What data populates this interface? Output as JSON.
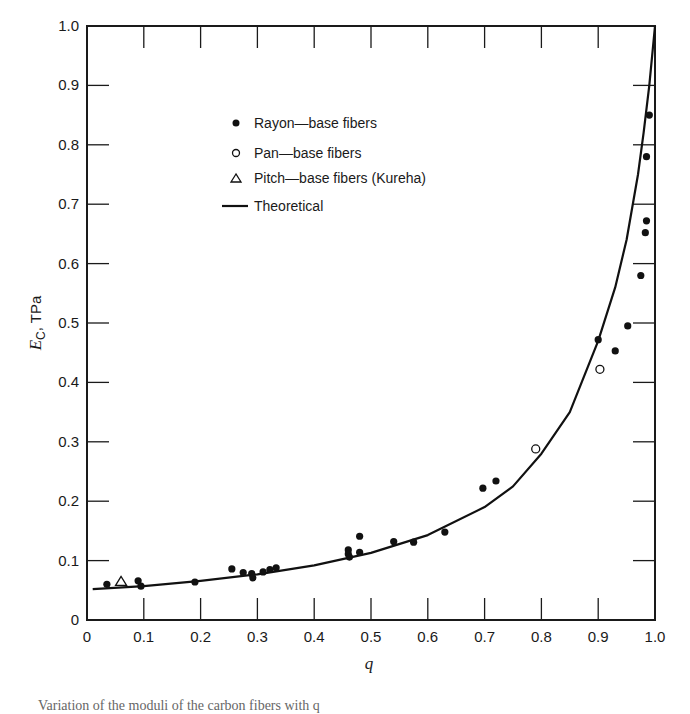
{
  "chart_data": {
    "type": "scatter",
    "title": "",
    "xlabel": "q",
    "ylabel": "E_C, TPa",
    "ylabel_main": "E",
    "ylabel_sub": "C",
    "ylabel_unit": ", TPa",
    "xlim": [
      0,
      1.0
    ],
    "ylim": [
      0,
      1.0
    ],
    "grid": false,
    "legend_position": "upper-left-inside",
    "x_ticks": [
      "0",
      "0.1",
      "0.2",
      "0.3",
      "0.4",
      "0.5",
      "0.6",
      "0.7",
      "0.8",
      "0.9",
      "1.0"
    ],
    "y_ticks": [
      "0",
      "0.1",
      "0.2",
      "0.3",
      "0.4",
      "0.5",
      "0.6",
      "0.7",
      "0.8",
      "0.9",
      "1.0"
    ],
    "legend": [
      {
        "marker": "filled-circle",
        "label": "Rayon—base fibers"
      },
      {
        "marker": "open-circle",
        "label": "Pan—base fibers"
      },
      {
        "marker": "open-triangle",
        "label": "Pitch—base fibers (Kureha)"
      },
      {
        "marker": "line",
        "label": "Theoretical"
      }
    ],
    "series": [
      {
        "name": "Rayon-base fibers",
        "marker": "filled-circle",
        "points": [
          [
            0.035,
            0.06
          ],
          [
            0.09,
            0.066
          ],
          [
            0.095,
            0.057
          ],
          [
            0.19,
            0.064
          ],
          [
            0.255,
            0.086
          ],
          [
            0.275,
            0.08
          ],
          [
            0.29,
            0.078
          ],
          [
            0.292,
            0.071
          ],
          [
            0.31,
            0.081
          ],
          [
            0.322,
            0.085
          ],
          [
            0.333,
            0.088
          ],
          [
            0.46,
            0.118
          ],
          [
            0.46,
            0.111
          ],
          [
            0.462,
            0.106
          ],
          [
            0.48,
            0.141
          ],
          [
            0.48,
            0.114
          ],
          [
            0.54,
            0.132
          ],
          [
            0.575,
            0.131
          ],
          [
            0.63,
            0.148
          ],
          [
            0.697,
            0.222
          ],
          [
            0.72,
            0.234
          ],
          [
            0.9,
            0.472
          ],
          [
            0.93,
            0.453
          ],
          [
            0.952,
            0.495
          ],
          [
            0.975,
            0.58
          ],
          [
            0.983,
            0.652
          ],
          [
            0.985,
            0.672
          ],
          [
            0.985,
            0.78
          ],
          [
            0.99,
            0.85
          ]
        ]
      },
      {
        "name": "Pan-base fibers",
        "marker": "open-circle",
        "points": [
          [
            0.79,
            0.288
          ],
          [
            0.903,
            0.422
          ]
        ]
      },
      {
        "name": "Pitch-base fibers (Kureha)",
        "marker": "open-triangle",
        "points": [
          [
            0.06,
            0.065
          ]
        ]
      },
      {
        "name": "Theoretical",
        "marker": "line",
        "points": [
          [
            0.01,
            0.052
          ],
          [
            0.1,
            0.057
          ],
          [
            0.2,
            0.066
          ],
          [
            0.3,
            0.077
          ],
          [
            0.4,
            0.092
          ],
          [
            0.5,
            0.113
          ],
          [
            0.6,
            0.143
          ],
          [
            0.7,
            0.19
          ],
          [
            0.75,
            0.225
          ],
          [
            0.8,
            0.28
          ],
          [
            0.85,
            0.35
          ],
          [
            0.9,
            0.47
          ],
          [
            0.93,
            0.56
          ],
          [
            0.95,
            0.64
          ],
          [
            0.97,
            0.75
          ],
          [
            0.98,
            0.82
          ],
          [
            0.99,
            0.9
          ],
          [
            1.0,
            1.0
          ]
        ]
      }
    ]
  },
  "caption_fragment": "Variation of the moduli of the carbon fibers with q"
}
